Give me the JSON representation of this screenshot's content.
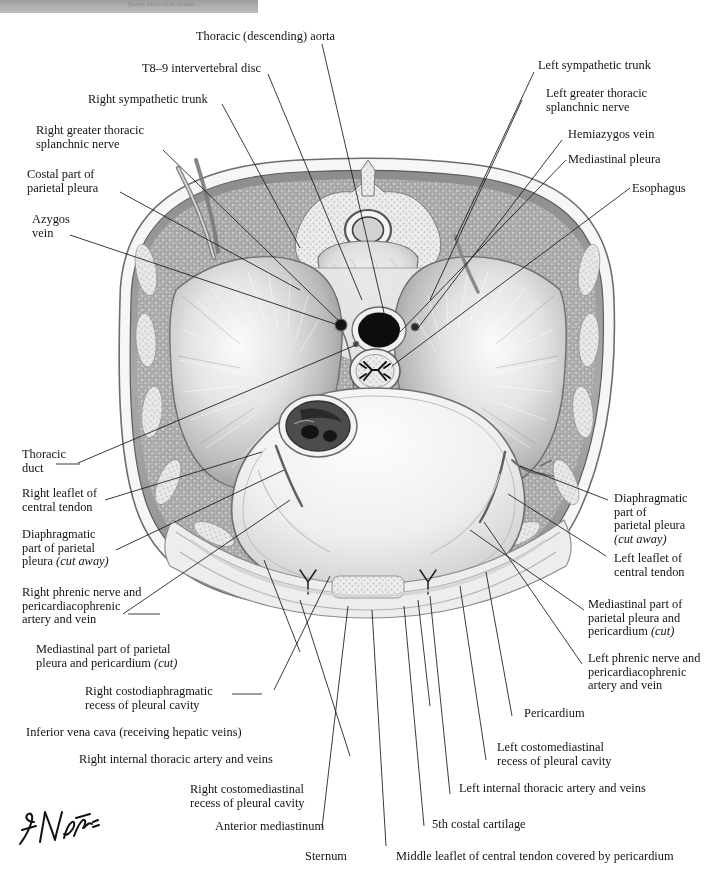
{
  "plate": {
    "title_banner": "Netter plate scan header",
    "signature": "F. Netter",
    "palette": {
      "ink": "#141414",
      "banner_top": "#9c9c9c",
      "banner_bottom": "#bdbdbd",
      "lung": "#d9d9d9",
      "chest_wall": "#9a9a9a",
      "pericardium_fill": "#ececec",
      "aorta": "#111111",
      "bone": "#e8e8e8"
    }
  },
  "labels": {
    "thoracic_aorta": "Thoracic (descending) aorta",
    "t89_disc": "T8–9 intervertebral disc",
    "right_sympathetic_trunk": "Right sympathetic trunk",
    "right_greater_splanchnic": "Right greater thoracic\nsplanchnic nerve",
    "costal_parietal_pleura": "Costal part of\nparietal pleura",
    "azygos_vein": "Azygos\nvein",
    "left_sympathetic_trunk": "Left sympathetic trunk",
    "left_greater_splanchnic": "Left greater thoracic\nsplanchnic nerve",
    "hemiazygos_vein": "Hemiazygos vein",
    "mediastinal_pleura": "Mediastinal pleura",
    "esophagus": "Esophagus",
    "thoracic_duct": "Thoracic\nduct",
    "right_leaflet": "Right leaflet of\ncentral tendon",
    "diaphragmatic_pleura_left_col": "Diaphragmatic\npart of parietal\npleura ",
    "diaphragmatic_pleura_left_col_it": "(cut away)",
    "right_phrenic": "Right phrenic nerve and\npericardiacophrenic\nartery and vein",
    "mediastinal_pericardium_left": "Mediastinal part of parietal\npleura and pericardium ",
    "mediastinal_pericardium_left_it": "(cut)",
    "right_costodiaphragmatic": "Right costodiaphragmatic\nrecess of pleural cavity",
    "ivc": "Inferior vena cava (receiving hepatic veins)",
    "right_internal_thoracic": "Right internal thoracic artery and veins",
    "right_costomediastinal": "Right costomediastinal\nrecess of pleural cavity",
    "anterior_mediastinum": "Anterior mediastinum",
    "sternum": "Sternum",
    "middle_leaflet": "Middle leaflet of central tendon covered by pericardium",
    "fifth_costal_cartilage": "5th costal cartilage",
    "left_internal_thoracic": "Left internal thoracic artery and veins",
    "left_costomediastinal": "Left costomediastinal\nrecess of pleural cavity",
    "pericardium": "Pericardium",
    "left_phrenic": "Left phrenic nerve and\npericardiacophrenic\nartery and vein",
    "mediastinal_pericardium_right": "Mediastinal part of\nparietal pleura and\npericardium ",
    "mediastinal_pericardium_right_it": "(cut)",
    "left_leaflet": "Left leaflet of\ncentral tendon",
    "diaphragmatic_pleura_right_col": "Diaphragmatic\npart of\nparietal pleura\n",
    "diaphragmatic_pleura_right_col_it": "(cut away)"
  }
}
